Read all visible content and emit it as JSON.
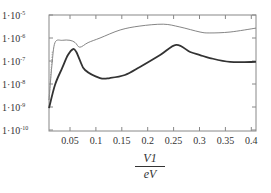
{
  "chart_data": {
    "type": "line",
    "title": "",
    "xlabel_numerator": "V1",
    "xlabel_denominator": "eV",
    "xlabel": "V1 / eV",
    "ylabel": "",
    "yscale": "log",
    "xlim": [
      0.0095,
      0.41
    ],
    "ylim": [
      1e-10,
      1e-05
    ],
    "grid": false,
    "legend": null,
    "x_ticks": [
      0.05,
      0.1,
      0.15,
      0.2,
      0.25,
      0.3,
      0.35,
      0.4
    ],
    "x_tick_labels": [
      "0.05",
      "0.1",
      "0.15",
      "0.2",
      "0.25",
      "0.3",
      "0.35",
      "0.4"
    ],
    "y_ticks_log10": [
      -5,
      -6,
      -7,
      -8,
      -9,
      -10
    ],
    "y_tick_labels": [
      "1·10",
      "1·10",
      "1·10",
      "1·10",
      "1·10",
      "1·10"
    ],
    "y_tick_exponents": [
      "-5",
      "-6",
      "-7",
      "-8",
      "-9",
      "-10"
    ],
    "series": [
      {
        "name": "upper (thin, dotted at low V1)",
        "style": "thin",
        "color": "#777777",
        "x": [
          0.0095,
          0.015,
          0.021,
          0.035,
          0.05,
          0.06,
          0.069,
          0.085,
          0.108,
          0.147,
          0.185,
          0.23,
          0.262,
          0.301,
          0.32,
          0.359,
          0.409
        ],
        "log10_y": [
          -8.7,
          -7.2,
          -6.2,
          -6.1,
          -6.1,
          -6.2,
          -6.4,
          -6.2,
          -6.0,
          -5.65,
          -5.48,
          -5.4,
          -5.52,
          -5.74,
          -5.78,
          -5.74,
          -5.57
        ]
      },
      {
        "name": "lower (thick)",
        "style": "thick",
        "color": "#333333",
        "x": [
          0.0095,
          0.021,
          0.035,
          0.046,
          0.056,
          0.062,
          0.069,
          0.079,
          0.108,
          0.127,
          0.156,
          0.185,
          0.224,
          0.255,
          0.282,
          0.301,
          0.32,
          0.359,
          0.409
        ],
        "log10_y": [
          -9.05,
          -8.04,
          -7.3,
          -6.74,
          -6.48,
          -6.6,
          -6.96,
          -7.39,
          -7.74,
          -7.74,
          -7.61,
          -7.26,
          -6.74,
          -6.3,
          -6.61,
          -6.74,
          -6.87,
          -7.04,
          -7.04
        ]
      }
    ]
  },
  "layout": {
    "plot_left": 49,
    "plot_right": 256,
    "plot_top": 15,
    "plot_bottom": 131,
    "x_px_per_unit": 518,
    "x_ref_value": 0.05,
    "x_ref_px": 70,
    "y_px_per_decade": 23,
    "y_ref_log10": -5,
    "y_ref_px": 15
  }
}
